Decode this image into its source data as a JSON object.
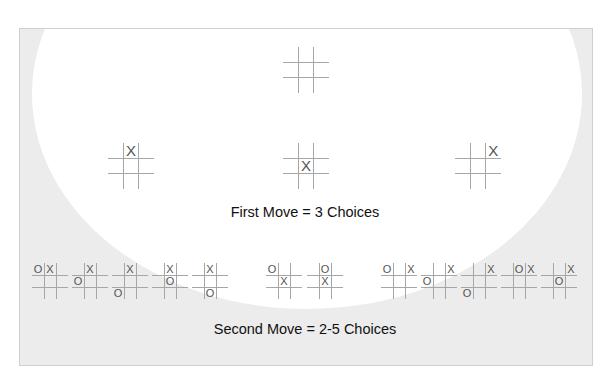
{
  "labels": {
    "first_move": "First Move = 3 Choices",
    "second_move": "Second Move = 2-5 Choices"
  },
  "colors": {
    "background": "#ececec",
    "ellipse": "#ffffff",
    "wave": "#b4b4b4",
    "grid_line": "#a6a6a6",
    "mark": "#555555",
    "text": "#111111"
  },
  "root_board": {
    "x": 283,
    "y": 47,
    "size": 46,
    "cells": [
      "",
      "",
      "",
      "",
      "",
      "",
      "",
      "",
      ""
    ]
  },
  "first_move_boards": [
    {
      "x": 108,
      "y": 143,
      "size": 46,
      "cells": [
        "",
        "X",
        "",
        "",
        "",
        "",
        "",
        "",
        ""
      ]
    },
    {
      "x": 283,
      "y": 143,
      "size": 46,
      "cells": [
        "",
        "",
        "",
        "",
        "X",
        "",
        "",
        "",
        ""
      ]
    },
    {
      "x": 455,
      "y": 143,
      "size": 46,
      "cells": [
        "",
        "",
        "X",
        "",
        "",
        "",
        "",
        "",
        ""
      ]
    }
  ],
  "second_move_groups": [
    {
      "parent": "X top-middle",
      "boards": [
        {
          "x": 32,
          "y": 263,
          "size": 36,
          "cells": [
            "O",
            "X",
            "",
            "",
            "",
            "",
            "",
            "",
            ""
          ]
        },
        {
          "x": 72,
          "y": 263,
          "size": 36,
          "cells": [
            "",
            "X",
            "",
            "O",
            "",
            "",
            "",
            "",
            ""
          ]
        },
        {
          "x": 112,
          "y": 263,
          "size": 36,
          "cells": [
            "",
            "X",
            "",
            "",
            "",
            "",
            "O",
            "",
            ""
          ]
        },
        {
          "x": 152,
          "y": 263,
          "size": 36,
          "cells": [
            "",
            "X",
            "",
            "",
            "O",
            "",
            "",
            "",
            ""
          ]
        },
        {
          "x": 192,
          "y": 263,
          "size": 36,
          "cells": [
            "",
            "X",
            "",
            "",
            "",
            "",
            "",
            "O",
            ""
          ]
        }
      ]
    },
    {
      "parent": "X center",
      "boards": [
        {
          "x": 266,
          "y": 263,
          "size": 36,
          "cells": [
            "O",
            "",
            "",
            "",
            "X",
            "",
            "",
            "",
            ""
          ]
        },
        {
          "x": 307,
          "y": 263,
          "size": 36,
          "cells": [
            "",
            "O",
            "",
            "",
            "X",
            "",
            "",
            "",
            ""
          ]
        }
      ]
    },
    {
      "parent": "X top-right",
      "boards": [
        {
          "x": 381,
          "y": 263,
          "size": 36,
          "cells": [
            "O",
            "",
            "X",
            "",
            "",
            "",
            "",
            "",
            ""
          ]
        },
        {
          "x": 421,
          "y": 263,
          "size": 36,
          "cells": [
            "",
            "",
            "X",
            "O",
            "",
            "",
            "",
            "",
            ""
          ]
        },
        {
          "x": 461,
          "y": 263,
          "size": 36,
          "cells": [
            "",
            "",
            "X",
            "",
            "",
            "",
            "O",
            "",
            ""
          ]
        },
        {
          "x": 501,
          "y": 263,
          "size": 36,
          "cells": [
            "",
            "O",
            "X",
            "",
            "",
            "",
            "",
            "",
            ""
          ]
        },
        {
          "x": 541,
          "y": 263,
          "size": 36,
          "cells": [
            "",
            "",
            "X",
            "",
            "O",
            "",
            "",
            "",
            ""
          ]
        }
      ]
    }
  ]
}
